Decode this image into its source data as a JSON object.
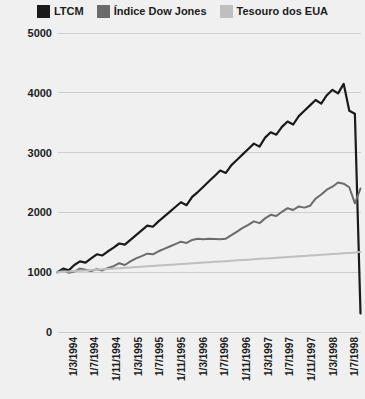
{
  "chart_data": {
    "type": "line",
    "title": "",
    "xlabel": "",
    "ylabel": "",
    "ylim": [
      0,
      5000
    ],
    "yticks": [
      0,
      1000,
      2000,
      3000,
      4000,
      5000
    ],
    "ytick_labels": [
      "0",
      "1000",
      "2000",
      "3000",
      "4000",
      "5000"
    ],
    "grid": true,
    "legend_position": "top",
    "background_color": "#f0f0f0",
    "gridline_color": "#cfcfcf",
    "x_tick_labels": [
      "1/3/1994",
      "1/7/1994",
      "1/11/1994",
      "1/3/1995",
      "1/7/1995",
      "1/11/1995",
      "1/3/1996",
      "1/7/1996",
      "1/11/1996",
      "1/3/1997",
      "1/7/1997",
      "1/11/1997",
      "1/3/1998",
      "1/7/1998"
    ],
    "x": [
      "1/3/1994",
      "1/4/1994",
      "1/5/1994",
      "1/6/1994",
      "1/7/1994",
      "1/8/1994",
      "1/9/1994",
      "1/10/1994",
      "1/11/1994",
      "1/12/1994",
      "1/1/1995",
      "1/2/1995",
      "1/3/1995",
      "1/4/1995",
      "1/5/1995",
      "1/6/1995",
      "1/7/1995",
      "1/8/1995",
      "1/9/1995",
      "1/10/1995",
      "1/11/1995",
      "1/12/1995",
      "1/1/1996",
      "1/2/1996",
      "1/3/1996",
      "1/4/1996",
      "1/5/1996",
      "1/6/1996",
      "1/7/1996",
      "1/8/1996",
      "1/9/1996",
      "1/10/1996",
      "1/11/1996",
      "1/12/1996",
      "1/1/1997",
      "1/2/1997",
      "1/3/1997",
      "1/4/1997",
      "1/5/1997",
      "1/6/1997",
      "1/7/1997",
      "1/8/1997",
      "1/9/1997",
      "1/10/1997",
      "1/11/1997",
      "1/12/1997",
      "1/1/1998",
      "1/2/1998",
      "1/3/1998",
      "1/4/1998",
      "1/5/1998",
      "1/6/1998",
      "1/7/1998",
      "1/8/1998",
      "1/9/1998"
    ],
    "series": [
      {
        "name": "LTCM",
        "color": "#1a1a1a",
        "width": 2.2,
        "values": [
          1000,
          1060,
          1030,
          1120,
          1180,
          1160,
          1230,
          1300,
          1280,
          1350,
          1410,
          1480,
          1460,
          1540,
          1620,
          1700,
          1780,
          1760,
          1850,
          1930,
          2010,
          2090,
          2170,
          2120,
          2260,
          2340,
          2430,
          2520,
          2610,
          2700,
          2660,
          2790,
          2880,
          2970,
          3060,
          3150,
          3100,
          3250,
          3340,
          3300,
          3430,
          3520,
          3470,
          3610,
          3700,
          3790,
          3880,
          3820,
          3960,
          4050,
          3990,
          4150,
          3700,
          3650,
          310
        ]
      },
      {
        "name": "Índice Dow Jones",
        "color": "#6b6b6b",
        "width": 2.0,
        "values": [
          1000,
          1030,
          990,
          1010,
          1060,
          1040,
          1020,
          1050,
          1030,
          1070,
          1100,
          1150,
          1120,
          1180,
          1230,
          1270,
          1310,
          1300,
          1350,
          1390,
          1430,
          1470,
          1510,
          1490,
          1540,
          1560,
          1550,
          1560,
          1555,
          1550,
          1560,
          1620,
          1680,
          1740,
          1790,
          1850,
          1820,
          1900,
          1960,
          1940,
          2010,
          2070,
          2040,
          2100,
          2080,
          2110,
          2230,
          2300,
          2380,
          2430,
          2500,
          2480,
          2420,
          2150,
          2400
        ]
      },
      {
        "name": "Tesouro dos EUA",
        "color": "#bfbfbf",
        "width": 2.0,
        "values": [
          1000,
          1006,
          1012,
          1018,
          1024,
          1030,
          1037,
          1043,
          1049,
          1055,
          1061,
          1068,
          1074,
          1080,
          1086,
          1092,
          1099,
          1105,
          1111,
          1117,
          1123,
          1130,
          1136,
          1142,
          1148,
          1154,
          1161,
          1167,
          1173,
          1179,
          1185,
          1192,
          1198,
          1204,
          1210,
          1216,
          1223,
          1229,
          1235,
          1241,
          1247,
          1254,
          1260,
          1266,
          1272,
          1278,
          1285,
          1291,
          1297,
          1303,
          1309,
          1316,
          1322,
          1328,
          1340
        ]
      }
    ]
  },
  "legend": {
    "items": [
      {
        "label": "LTCM",
        "color": "#1a1a1a"
      },
      {
        "label": "Índice Dow Jones",
        "color": "#6b6b6b"
      },
      {
        "label": "Tesouro dos EUA",
        "color": "#bfbfbf"
      }
    ]
  }
}
